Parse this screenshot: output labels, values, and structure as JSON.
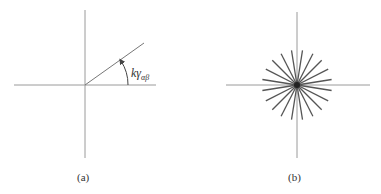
{
  "panels": [
    {
      "id": "a",
      "caption": "(a)",
      "angle_label": {
        "main": "kγ",
        "sub": "αβ"
      },
      "origin": [
        85,
        85
      ],
      "ray_end": [
        144,
        43
      ]
    },
    {
      "id": "b",
      "caption": "(b)",
      "origin": [
        297,
        85
      ],
      "ray_count": 20,
      "ray_radius": 35,
      "ray_offset_deg": 9
    }
  ],
  "colors": {
    "axis": "#9a9a9a",
    "ray": "#555555",
    "star": "#333333"
  }
}
